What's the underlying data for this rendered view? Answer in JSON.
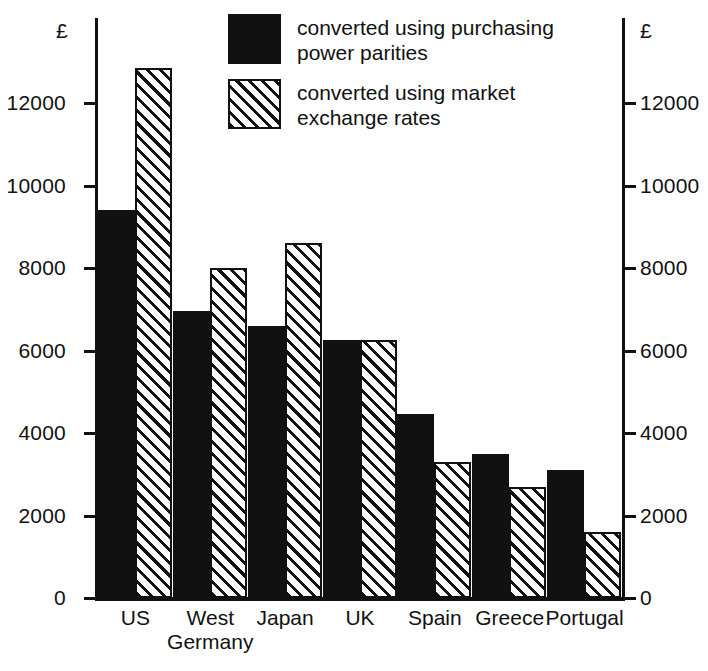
{
  "chart_data": {
    "type": "bar",
    "title": "",
    "subtitle": "",
    "xlabel": "",
    "ylabel": "£",
    "ylim": [
      0,
      13500
    ],
    "yticks": [
      0,
      2000,
      4000,
      6000,
      8000,
      10000,
      12000
    ],
    "ytick_labels": [
      "0",
      "2000",
      "4000",
      "6000",
      "8000",
      "10000",
      "12000"
    ],
    "grid": false,
    "legend_position": "top-center",
    "axis_currency_symbol": "£",
    "left_axis_currency_symbol": "£",
    "right_axis_currency_symbol": "£",
    "right_axis_tick_labels": [
      "0",
      "2000",
      "4000",
      "6000",
      "8000",
      "10000",
      "12000"
    ],
    "categories": [
      "US",
      "West Germany",
      "Japan",
      "UK",
      "Spain",
      "Greece",
      "Portugal"
    ],
    "category_label_lines": [
      [
        "US"
      ],
      [
        "West",
        "Germany"
      ],
      [
        "Japan"
      ],
      [
        "UK"
      ],
      [
        "Spain"
      ],
      [
        "Greece"
      ],
      [
        "Portugal"
      ]
    ],
    "series": [
      {
        "name": "converted using purchasing power parities",
        "fill": "solid-black",
        "color": "#111111",
        "values": [
          9400,
          6950,
          6600,
          6250,
          4450,
          3500,
          3100
        ]
      },
      {
        "name": "converted using market exchange rates",
        "fill": "diagonal-hatch",
        "color": "#111111",
        "values": [
          12850,
          8000,
          8600,
          6250,
          3300,
          2700,
          1600
        ]
      }
    ]
  },
  "legend": {
    "items": [
      {
        "label_line1": "converted using purchasing",
        "label_line2": "power parities",
        "swatch": "solid-black"
      },
      {
        "label_line1": "converted using market",
        "label_line2": "exchange rates",
        "swatch": "diagonal-hatch"
      }
    ]
  },
  "axes": {
    "left_currency": "£",
    "right_currency": "£"
  }
}
